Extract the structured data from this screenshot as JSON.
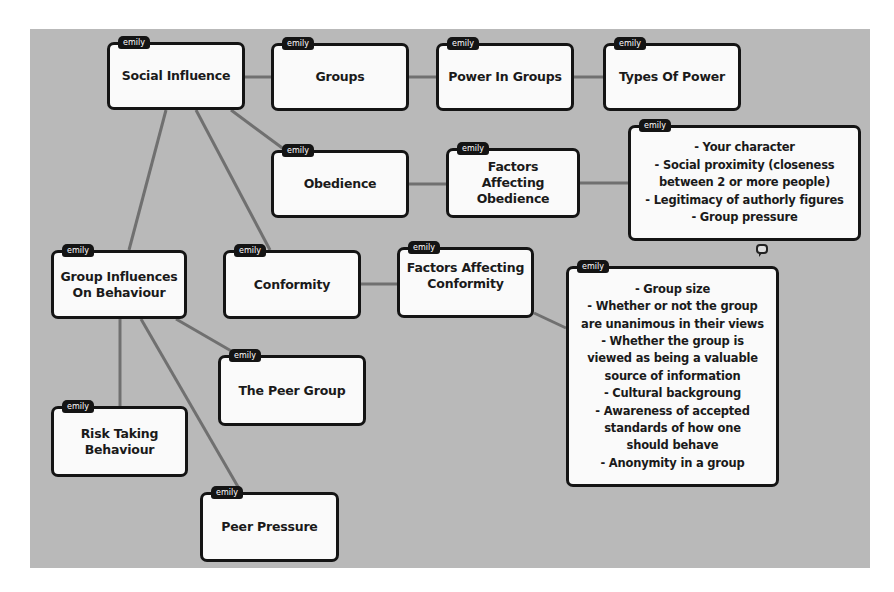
{
  "canvas": {
    "background": "#b9b9b9",
    "link_color": "#707070",
    "node_border": "#141414"
  },
  "author_tag": "emily",
  "nodes": [
    {
      "id": "social-influence",
      "label": "Social Influence",
      "author": "emily"
    },
    {
      "id": "groups",
      "label": "Groups",
      "author": "emily"
    },
    {
      "id": "power-in-groups",
      "label": "Power In Groups",
      "author": "emily"
    },
    {
      "id": "types-of-power",
      "label": "Types Of Power",
      "author": "emily"
    },
    {
      "id": "obedience",
      "label": "Obedience",
      "author": "emily"
    },
    {
      "id": "factors-affecting-obedience",
      "label": "Factors Affecting\nObedience",
      "author": "emily"
    },
    {
      "id": "obedience-factors-list",
      "label": "- Your character\n- Social proximity (closeness\nbetween 2 or more people)\n- Legitimacy of authorly figures\n- Group pressure",
      "author": "emily"
    },
    {
      "id": "group-influences-on-behaviour",
      "label": "Group Influences\nOn Behaviour",
      "author": "emily"
    },
    {
      "id": "conformity",
      "label": "Conformity",
      "author": "emily"
    },
    {
      "id": "factors-affecting-conformity",
      "label": "Factors Affecting\nConformity",
      "author": "emily"
    },
    {
      "id": "conformity-factors-list",
      "label": "- Group size\n- Whether or not the group\nare unanimous in their views\n- Whether the group is\nviewed as being a valuable\nsource of information\n- Cultural backgroung\n- Awareness of accepted\nstandards of how one\nshould behave\n- Anonymity in a group",
      "author": "emily"
    },
    {
      "id": "the-peer-group",
      "label": "The Peer Group",
      "author": "emily"
    },
    {
      "id": "risk-taking-behaviour",
      "label": "Risk Taking\nBehaviour",
      "author": "emily"
    },
    {
      "id": "peer-pressure",
      "label": "Peer Pressure",
      "author": "emily"
    }
  ],
  "links": [
    [
      "social-influence",
      "groups"
    ],
    [
      "groups",
      "power-in-groups"
    ],
    [
      "power-in-groups",
      "types-of-power"
    ],
    [
      "social-influence",
      "obedience"
    ],
    [
      "obedience",
      "factors-affecting-obedience"
    ],
    [
      "factors-affecting-obedience",
      "obedience-factors-list"
    ],
    [
      "social-influence",
      "group-influences-on-behaviour"
    ],
    [
      "social-influence",
      "conformity"
    ],
    [
      "conformity",
      "factors-affecting-conformity"
    ],
    [
      "factors-affecting-conformity",
      "conformity-factors-list"
    ],
    [
      "group-influences-on-behaviour",
      "the-peer-group"
    ],
    [
      "group-influences-on-behaviour",
      "risk-taking-behaviour"
    ],
    [
      "group-influences-on-behaviour",
      "peer-pressure"
    ]
  ],
  "icons": {
    "comment": "speech-bubble-icon"
  }
}
